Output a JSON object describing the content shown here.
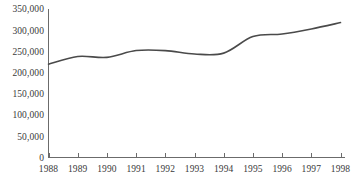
{
  "chart_data": {
    "type": "line",
    "title": "",
    "subtitle": "",
    "xlabel": "",
    "ylabel": "",
    "categories": [
      "1988",
      "1989",
      "1990",
      "1991",
      "1992",
      "1993",
      "1994",
      "1995",
      "1996",
      "1997",
      "1998"
    ],
    "x": [
      1988,
      1989,
      1990,
      1991,
      1992,
      1993,
      1994,
      1995,
      1996,
      1997,
      1998
    ],
    "values": [
      220000,
      238000,
      236000,
      252000,
      252000,
      244000,
      246000,
      285000,
      291000,
      303000,
      318000
    ],
    "series": [
      {
        "name": "",
        "values": [
          220000,
          238000,
          236000,
          252000,
          252000,
          244000,
          246000,
          285000,
          291000,
          303000,
          318000
        ]
      }
    ],
    "xlim": [
      1988,
      1998
    ],
    "ylim": [
      0,
      350000
    ],
    "ytick_values": [
      0,
      50000,
      100000,
      150000,
      200000,
      250000,
      300000,
      350000
    ],
    "ytick_labels": [
      "0",
      "50,000",
      "100,000",
      "150,000",
      "200,000",
      "250,000",
      "300,000",
      "350,000"
    ],
    "xtick_labels": [
      "1988",
      "1989",
      "1990",
      "1991",
      "1992",
      "1993",
      "1994",
      "1995",
      "1996",
      "1997",
      "1998"
    ],
    "grid": false,
    "legend": false,
    "legend_position": "none",
    "line_color": "#4a4a4a",
    "axis_color": "#6b6b6b",
    "text_color": "#3a3a3a",
    "background_color": "#ffffff",
    "markers": false,
    "smoothing": true
  },
  "axes": {
    "y_axis_name": "y-axis",
    "x_axis_name": "x-axis"
  }
}
